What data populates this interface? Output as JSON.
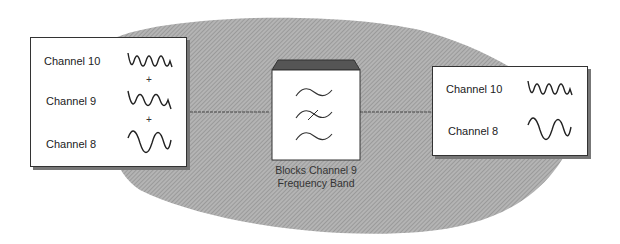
{
  "input_box": {
    "channels": [
      {
        "label": "Channel 10",
        "wave": "high-frequency"
      },
      {
        "label": "Channel 9",
        "wave": "medium-frequency"
      },
      {
        "label": "Channel 8",
        "wave": "low-frequency"
      }
    ],
    "operator": "+"
  },
  "filter": {
    "caption_line1": "Blocks Channel 9",
    "caption_line2": "Frequency Band",
    "icon": "band-stop-filter-icon"
  },
  "output_box": {
    "channels": [
      {
        "label": "Channel 10",
        "wave": "high-frequency"
      },
      {
        "label": "Channel 8",
        "wave": "low-frequency"
      }
    ]
  },
  "colors": {
    "background_blob": "#9a9a9a",
    "box_fill": "#ffffff",
    "border": "#333333",
    "filter_top": "#555555"
  }
}
